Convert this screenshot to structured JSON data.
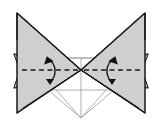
{
  "figure": {
    "kind": "origami-fold-diagram",
    "canvas": {
      "width": 162,
      "height": 126
    },
    "colors": {
      "background": "#ffffff",
      "paper_fill": "#cfcfcf",
      "paper_fill_light": "#dcdcdc",
      "paper_fill_shadow": "#bdbdbd",
      "edge_stroke": "#1a1a1a",
      "thin_stroke": "#9a9a9a",
      "dashed_stroke": "#1a1a1a",
      "arrow_stroke": "#111111"
    },
    "stroke_widths": {
      "edge": 1.4,
      "thin": 0.8,
      "dashed": 1.4,
      "arrow": 1.3
    },
    "center_point": {
      "x": 81,
      "y": 70
    },
    "shapes": {
      "left_wing_outer": "18,14 81,70 18,112",
      "right_wing_outer": "144,14 81,70 144,112",
      "left_wing_inner": "24,18 81,70 24,108",
      "right_wing_inner": "138,18 81,70 138,108",
      "left_flap": "14,55 48,58 48,84 14,87",
      "right_flap": "148,55 114,58 114,84 148,87",
      "base_outline": "48,58 114,58 114,90 81,118 48,90",
      "base_top_edge": "48,58 114,58",
      "base_bottom_v": "56,90 81,118 106,90",
      "center_vertical": "81,58 81,118"
    },
    "fold_lines": [
      {
        "name": "left-valley-fold",
        "x1": 22,
        "y1": 70,
        "x2": 78,
        "y2": 70,
        "style": "dashed"
      },
      {
        "name": "right-valley-fold",
        "x1": 84,
        "y1": 70,
        "x2": 140,
        "y2": 70,
        "style": "dashed"
      }
    ],
    "arrows": [
      {
        "name": "left-fold-arrow",
        "direction": "up",
        "tip": {
          "x": 47,
          "y": 58
        },
        "tail": {
          "x": 50,
          "y": 82
        },
        "label": ""
      },
      {
        "name": "right-fold-arrow",
        "direction": "up",
        "tip": {
          "x": 115,
          "y": 58
        },
        "tail": {
          "x": 112,
          "y": 82
        },
        "label": ""
      }
    ],
    "legend": {
      "dashed_meaning": "valley fold",
      "arrow_meaning": "fold in direction of arrow"
    }
  }
}
